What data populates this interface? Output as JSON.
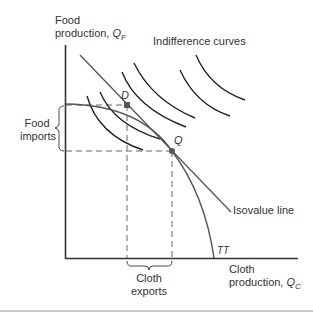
{
  "diagram": {
    "y_axis_label_line1": "Food",
    "y_axis_label_line2": "production, ",
    "y_axis_symbol": "Q",
    "y_axis_sub": "F",
    "x_axis_label_line1": "Cloth",
    "x_axis_label_line2": "production, ",
    "x_axis_symbol": "Q",
    "x_axis_sub": "C",
    "indifference_label": "Indifference curves",
    "isovalue_label": "Isovalue line",
    "ppf_label": "TT",
    "point_d": "D",
    "point_q": "Q",
    "food_imports_line1": "Food",
    "food_imports_line2": "imports",
    "cloth_exports_line1": "Cloth",
    "cloth_exports_line2": "exports"
  },
  "colors": {
    "axis": "#333333",
    "curve": "#222222",
    "line": "#555555",
    "dash": "#666666",
    "rule": "#999999"
  }
}
